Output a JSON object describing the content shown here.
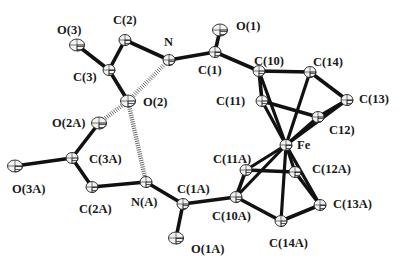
{
  "figure": {
    "type": "ORTEP molecular structure",
    "colors": {
      "bond": "#111111",
      "atom_fill": "#f2f2f2",
      "atom_stroke": "#222222",
      "hbond": "#555555",
      "background": "#ffffff"
    }
  },
  "atoms": [
    {
      "id": "O3",
      "label": "O(3)",
      "x": 77,
      "y": 45,
      "lx": 57,
      "ly": 24
    },
    {
      "id": "C2",
      "label": "C(2)",
      "x": 125,
      "y": 40,
      "lx": 113,
      "ly": 14
    },
    {
      "id": "N",
      "label": "N",
      "x": 169,
      "y": 60,
      "lx": 164,
      "ly": 36
    },
    {
      "id": "C3",
      "label": "C(3)",
      "x": 109,
      "y": 70,
      "lx": 73,
      "ly": 71
    },
    {
      "id": "O2",
      "label": "O(2)",
      "x": 128,
      "y": 101,
      "lx": 143,
      "ly": 96
    },
    {
      "id": "O1",
      "label": "O(1)",
      "x": 220,
      "y": 30,
      "lx": 236,
      "ly": 20
    },
    {
      "id": "C1",
      "label": "C(1)",
      "x": 215,
      "y": 52,
      "lx": 198,
      "ly": 64
    },
    {
      "id": "C10",
      "label": "C(10)",
      "x": 259,
      "y": 71,
      "lx": 254,
      "ly": 55
    },
    {
      "id": "C14",
      "label": "C(14)",
      "x": 310,
      "y": 72,
      "lx": 313,
      "ly": 56
    },
    {
      "id": "C13",
      "label": "C(13)",
      "x": 347,
      "y": 100,
      "lx": 359,
      "ly": 93
    },
    {
      "id": "C11",
      "label": "C(11)",
      "x": 262,
      "y": 101,
      "lx": 216,
      "ly": 95
    },
    {
      "id": "C12",
      "label": "C12)",
      "x": 318,
      "y": 117,
      "lx": 329,
      "ly": 124
    },
    {
      "id": "Fe",
      "label": "Fe",
      "x": 286,
      "y": 145,
      "lx": 297,
      "ly": 139
    },
    {
      "id": "O2A",
      "label": "O(2A)",
      "x": 99,
      "y": 123,
      "lx": 52,
      "ly": 117
    },
    {
      "id": "C3A",
      "label": "C(3A)",
      "x": 72,
      "y": 158,
      "lx": 89,
      "ly": 153
    },
    {
      "id": "O3A",
      "label": "O(3A)",
      "x": 15,
      "y": 166,
      "lx": 12,
      "ly": 183
    },
    {
      "id": "C2A",
      "label": "C(2A)",
      "x": 92,
      "y": 187,
      "lx": 79,
      "ly": 203
    },
    {
      "id": "NA",
      "label": "N(A)",
      "x": 146,
      "y": 182,
      "lx": 131,
      "ly": 196
    },
    {
      "id": "C1A",
      "label": "C(1A)",
      "x": 183,
      "y": 204,
      "lx": 177,
      "ly": 183
    },
    {
      "id": "O1A",
      "label": "O(1A)",
      "x": 176,
      "y": 238,
      "lx": 191,
      "ly": 243
    },
    {
      "id": "C10A",
      "label": "C(10A)",
      "x": 236,
      "y": 197,
      "lx": 212,
      "ly": 210
    },
    {
      "id": "C11A",
      "label": "C(11A)",
      "x": 246,
      "y": 170,
      "lx": 213,
      "ly": 153
    },
    {
      "id": "C12A",
      "label": "C(12A)",
      "x": 295,
      "y": 172,
      "lx": 312,
      "ly": 163
    },
    {
      "id": "C13A",
      "label": "C(13A)",
      "x": 320,
      "y": 205,
      "lx": 333,
      "ly": 198
    },
    {
      "id": "C14A",
      "label": "C(14A)",
      "x": 281,
      "y": 221,
      "lx": 269,
      "ly": 237
    }
  ],
  "bonds": [
    [
      "O3",
      "C3"
    ],
    [
      "C3",
      "C2"
    ],
    [
      "C2",
      "N"
    ],
    [
      "N",
      "C1"
    ],
    [
      "C1",
      "O1"
    ],
    [
      "C1",
      "C10"
    ],
    [
      "C3",
      "O2"
    ],
    [
      "C10",
      "C14"
    ],
    [
      "C14",
      "C13"
    ],
    [
      "C13",
      "C12"
    ],
    [
      "C12",
      "C11"
    ],
    [
      "C11",
      "C10"
    ],
    [
      "C10",
      "Fe"
    ],
    [
      "C11",
      "Fe"
    ],
    [
      "C14",
      "Fe"
    ],
    [
      "C12",
      "Fe"
    ],
    [
      "C13",
      "Fe"
    ],
    [
      "O2A",
      "C3A"
    ],
    [
      "C3A",
      "O3A"
    ],
    [
      "C3A",
      "C2A"
    ],
    [
      "C2A",
      "NA"
    ],
    [
      "NA",
      "C1A"
    ],
    [
      "C1A",
      "O1A"
    ],
    [
      "C1A",
      "C10A"
    ],
    [
      "C10A",
      "C11A"
    ],
    [
      "C11A",
      "C12A"
    ],
    [
      "C12A",
      "C13A"
    ],
    [
      "C13A",
      "C14A"
    ],
    [
      "C14A",
      "C10A"
    ],
    [
      "C10A",
      "Fe"
    ],
    [
      "C11A",
      "Fe"
    ],
    [
      "C12A",
      "Fe"
    ],
    [
      "C13A",
      "Fe"
    ],
    [
      "C14A",
      "Fe"
    ]
  ],
  "hydrogen_bonds": [
    [
      "N",
      "O2"
    ],
    [
      "O2",
      "O2A"
    ],
    [
      "O2",
      "NA"
    ]
  ]
}
